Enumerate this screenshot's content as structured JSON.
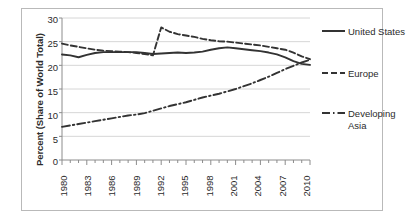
{
  "chart_data": {
    "type": "line",
    "title": "",
    "xlabel": "",
    "ylabel": "Percent (Share of World Total)",
    "xlim": [
      1980,
      2010
    ],
    "ylim": [
      0,
      30
    ],
    "yticks": [
      0,
      5,
      10,
      15,
      20,
      25,
      30
    ],
    "xticks": [
      1980,
      1983,
      1986,
      1989,
      1992,
      1995,
      1998,
      2001,
      2004,
      2007,
      2010
    ],
    "grid": "horizontal",
    "legend_position": "right",
    "x": [
      1980,
      1981,
      1982,
      1983,
      1984,
      1985,
      1986,
      1987,
      1988,
      1989,
      1990,
      1991,
      1992,
      1993,
      1994,
      1995,
      1996,
      1997,
      1998,
      1999,
      2000,
      2001,
      2002,
      2003,
      2004,
      2005,
      2006,
      2007,
      2008,
      2009,
      2010
    ],
    "series": [
      {
        "name": "United States",
        "linestyle": "solid",
        "color": "#333333",
        "values": [
          22.3,
          22.1,
          21.7,
          22.2,
          22.6,
          22.8,
          22.8,
          22.8,
          22.8,
          22.8,
          22.6,
          22.4,
          22.5,
          22.6,
          22.7,
          22.6,
          22.7,
          22.9,
          23.3,
          23.6,
          23.8,
          23.6,
          23.4,
          23.2,
          23.0,
          22.7,
          22.3,
          21.7,
          20.9,
          20.3,
          20.1
        ]
      },
      {
        "name": "Europe",
        "linestyle": "dashed",
        "color": "#333333",
        "values": [
          24.6,
          24.2,
          23.9,
          23.6,
          23.3,
          23.1,
          23.0,
          22.9,
          22.8,
          22.6,
          22.4,
          22.1,
          28.0,
          27.1,
          26.6,
          26.3,
          26.0,
          25.6,
          25.3,
          25.1,
          25.0,
          24.8,
          24.6,
          24.4,
          24.2,
          23.9,
          23.6,
          23.3,
          22.7,
          21.9,
          21.3
        ]
      },
      {
        "name": "Developing Asia",
        "linestyle": "dashdot",
        "color": "#333333",
        "values": [
          7.0,
          7.3,
          7.6,
          7.9,
          8.2,
          8.5,
          8.8,
          9.1,
          9.4,
          9.6,
          9.9,
          10.4,
          10.9,
          11.4,
          11.8,
          12.2,
          12.7,
          13.2,
          13.6,
          14.0,
          14.5,
          15.0,
          15.6,
          16.2,
          16.9,
          17.6,
          18.4,
          19.2,
          19.9,
          20.6,
          21.2
        ]
      }
    ],
    "legend": [
      {
        "label": "United States",
        "linestyle": "solid"
      },
      {
        "label": "Europe",
        "linestyle": "dashed"
      },
      {
        "label": "Developing Asia",
        "linestyle": "dashdot"
      }
    ]
  }
}
